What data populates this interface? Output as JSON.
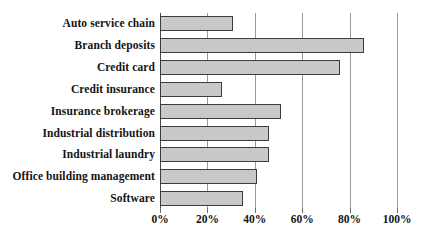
{
  "chart_data": {
    "type": "bar",
    "orientation": "horizontal",
    "title": "",
    "subtitle": "",
    "xlabel": "",
    "ylabel": "",
    "categories": [
      "Auto service chain",
      "Branch deposits",
      "Credit card",
      "Credit insurance",
      "Insurance brokerage",
      "Industrial distribution",
      "Industrial laundry",
      "Office building management",
      "Software"
    ],
    "values": [
      31,
      86,
      76,
      26,
      51,
      46,
      46,
      41,
      35
    ],
    "value_unit": "%",
    "xlim": [
      0,
      100
    ],
    "xticks": [
      0,
      20,
      40,
      60,
      80,
      100
    ],
    "xtick_labels": [
      "0%",
      "20%",
      "40%",
      "60%",
      "80%",
      "100%"
    ],
    "grid": true,
    "grid_axis": "x",
    "legend": null,
    "legend_position": "none",
    "series": [
      {
        "name": "",
        "values": [
          31,
          86,
          76,
          26,
          51,
          46,
          46,
          41,
          35
        ]
      }
    ]
  },
  "style": {
    "bar_fill": "#c9c9c9",
    "bar_stroke": "#3c3c3c",
    "gridline_color": "#9a9a9a",
    "axis_color": "#4a4a4a",
    "text_color": "#141414",
    "background": "#ffffff"
  }
}
